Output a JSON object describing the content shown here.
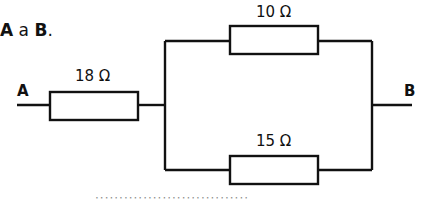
{
  "heading": {
    "part1": "A",
    "part2": " a ",
    "part3": "B",
    "part4": "."
  },
  "nodes": {
    "left": "A",
    "right": "B"
  },
  "resistors": [
    {
      "id": "R1",
      "label": "18 Ω",
      "position": "series"
    },
    {
      "id": "R2",
      "label": "10 Ω",
      "position": "parallel-top"
    },
    {
      "id": "R3",
      "label": "15 Ω",
      "position": "parallel-bottom"
    }
  ],
  "footer_cut_text": "································"
}
